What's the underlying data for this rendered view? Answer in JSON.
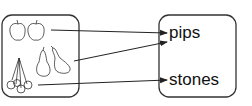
{
  "diagram": {
    "left_box": {
      "items": [
        {
          "name": "apple",
          "count": 2,
          "icon": "apple-icon"
        },
        {
          "name": "pear",
          "count": 2,
          "icon": "pear-icon"
        },
        {
          "name": "cherry",
          "count": 4,
          "icon": "cherry-icon"
        }
      ]
    },
    "right_box": {
      "labels": [
        "pips",
        "stones"
      ]
    },
    "arrows": [
      {
        "from": "apple",
        "to": "pips"
      },
      {
        "from": "pear",
        "to": "pips"
      },
      {
        "from": "cherry",
        "to": "stones"
      }
    ],
    "colors": {
      "stroke": "#222222",
      "background": "#ffffff"
    }
  }
}
